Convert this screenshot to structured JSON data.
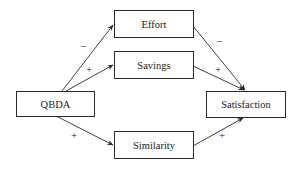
{
  "nodes": {
    "effort": {
      "label": "Effort"
    },
    "savings": {
      "label": "Savings"
    },
    "qbda": {
      "label": "QBDA"
    },
    "satisfaction": {
      "label": "Satisfaction"
    },
    "similarity": {
      "label": "Similarity"
    }
  },
  "edges": [
    {
      "from": "QBDA",
      "to": "Effort",
      "sign": "−"
    },
    {
      "from": "QBDA",
      "to": "Savings",
      "sign": "+"
    },
    {
      "from": "QBDA",
      "to": "Similarity",
      "sign": "+"
    },
    {
      "from": "Effort",
      "to": "Satisfaction",
      "sign": "−"
    },
    {
      "from": "Savings",
      "to": "Satisfaction",
      "sign": "+"
    },
    {
      "from": "Similarity",
      "to": "Satisfaction",
      "sign": "+"
    }
  ],
  "colors": {
    "line": "#2a2a2a",
    "background": "#ffffff"
  }
}
